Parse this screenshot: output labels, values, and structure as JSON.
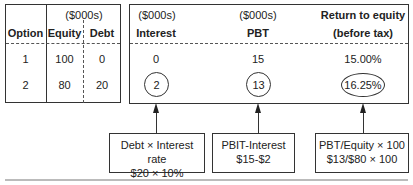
{
  "left_table": {
    "unit_label": "($000s)",
    "headers": [
      "Option",
      "Equity",
      "Debt"
    ],
    "rows": [
      {
        "option": "1",
        "equity": "100",
        "debt": "0"
      },
      {
        "option": "2",
        "equity": "80",
        "debt": "20"
      }
    ]
  },
  "right_table": {
    "columns": [
      {
        "unit": "($000s)",
        "header": "Interest",
        "values": [
          "0",
          "2"
        ]
      },
      {
        "unit": "($000s)",
        "header": "PBT",
        "values": [
          "15",
          "13"
        ]
      },
      {
        "unit": "Return to equity",
        "header": "(before tax)",
        "values": [
          "15.00%",
          "16.25%"
        ]
      }
    ]
  },
  "notes": [
    {
      "line1": "Debt × Interest rate",
      "line2": "$20 × 10%"
    },
    {
      "line1": "PBIT-Interest",
      "line2": "$15-$2"
    },
    {
      "line1": "PBT/Equity × 100",
      "line2": "$13/$80 × 100"
    }
  ]
}
